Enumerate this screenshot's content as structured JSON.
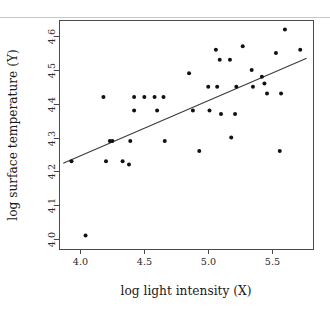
{
  "chart_data": {
    "type": "scatter",
    "title": "",
    "xlabel": "log light intensity (X)",
    "ylabel": "log surface temperature (Y)",
    "xlim": [
      3.84,
      5.82
    ],
    "ylim": [
      3.97,
      4.645
    ],
    "xticks": [
      4.0,
      4.5,
      5.0,
      5.5
    ],
    "xticklabels": [
      "4.0",
      "4.5",
      "5.0",
      "5.5"
    ],
    "yticks": [
      4.0,
      4.1,
      4.2,
      4.3,
      4.4,
      4.5,
      4.6
    ],
    "yticklabels": [
      "4.0",
      "4.1",
      "4.2",
      "4.3",
      "4.4",
      "4.5",
      "4.6"
    ],
    "grid": false,
    "legend": null,
    "marker": "filled-circle",
    "marker_color": "#111111",
    "points": [
      {
        "x": 3.93,
        "y": 4.23
      },
      {
        "x": 4.04,
        "y": 4.01
      },
      {
        "x": 4.18,
        "y": 4.42
      },
      {
        "x": 4.2,
        "y": 4.23
      },
      {
        "x": 4.23,
        "y": 4.29
      },
      {
        "x": 4.25,
        "y": 4.29
      },
      {
        "x": 4.33,
        "y": 4.23
      },
      {
        "x": 4.38,
        "y": 4.22
      },
      {
        "x": 4.39,
        "y": 4.29
      },
      {
        "x": 4.42,
        "y": 4.42
      },
      {
        "x": 4.42,
        "y": 4.38
      },
      {
        "x": 4.5,
        "y": 4.42
      },
      {
        "x": 4.58,
        "y": 4.42
      },
      {
        "x": 4.6,
        "y": 4.38
      },
      {
        "x": 4.65,
        "y": 4.42
      },
      {
        "x": 4.66,
        "y": 4.29
      },
      {
        "x": 4.85,
        "y": 4.49
      },
      {
        "x": 4.88,
        "y": 4.38
      },
      {
        "x": 4.93,
        "y": 4.26
      },
      {
        "x": 5.0,
        "y": 4.45
      },
      {
        "x": 5.01,
        "y": 4.38
      },
      {
        "x": 5.06,
        "y": 4.56
      },
      {
        "x": 5.07,
        "y": 4.45
      },
      {
        "x": 5.09,
        "y": 4.53
      },
      {
        "x": 5.1,
        "y": 4.37
      },
      {
        "x": 5.17,
        "y": 4.53
      },
      {
        "x": 5.18,
        "y": 4.3
      },
      {
        "x": 5.21,
        "y": 4.37
      },
      {
        "x": 5.22,
        "y": 4.45
      },
      {
        "x": 5.27,
        "y": 4.57
      },
      {
        "x": 5.34,
        "y": 4.5
      },
      {
        "x": 5.35,
        "y": 4.45
      },
      {
        "x": 5.42,
        "y": 4.48
      },
      {
        "x": 5.44,
        "y": 4.46
      },
      {
        "x": 5.46,
        "y": 4.43
      },
      {
        "x": 5.53,
        "y": 4.55
      },
      {
        "x": 5.56,
        "y": 4.26
      },
      {
        "x": 5.57,
        "y": 4.43
      },
      {
        "x": 5.6,
        "y": 4.62
      },
      {
        "x": 5.72,
        "y": 4.56
      }
    ],
    "fit_line": {
      "type": "linear-regression",
      "x_start": 3.865,
      "y_start": 4.224,
      "x_end": 5.77,
      "y_end": 4.535
    }
  }
}
